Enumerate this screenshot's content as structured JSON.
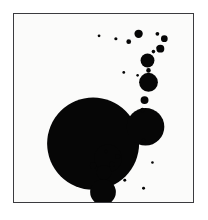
{
  "figure": {
    "title": "",
    "background_color": "#ffffff",
    "panel_background_color": "#fbfbfa",
    "frame_color": "#3b3b3f",
    "mark_color": "#060606",
    "panel": {
      "x": 13,
      "y": 13,
      "width": 181,
      "height": 190
    }
  },
  "chart_data": {
    "type": "scatter",
    "title": "",
    "subtitle": "",
    "xlabel": "",
    "ylabel": "",
    "xlim": [
      0,
      181
    ],
    "ylim": [
      0,
      190
    ],
    "grid": false,
    "legend": null,
    "axis_ticks": {
      "x": [],
      "y": []
    },
    "annotations": [],
    "marker": {
      "shape": "circle",
      "fill": "#060606",
      "edge": "none",
      "size_encodes": "radius"
    },
    "series": [
      {
        "name": "discs",
        "points": [
          {
            "id": "c1",
            "x": 80,
            "y": 131,
            "r": 46.5
          },
          {
            "id": "c2",
            "x": 133,
            "y": 114,
            "r": 19.0
          },
          {
            "id": "c3",
            "x": 90,
            "y": 180,
            "r": 13.0
          },
          {
            "id": "c4",
            "x": 95,
            "y": 146,
            "r": 14.0
          },
          {
            "id": "c5",
            "x": 136,
            "y": 69,
            "r": 9.5
          },
          {
            "id": "c6",
            "x": 91,
            "y": 160,
            "r": 7.5
          },
          {
            "id": "c7",
            "x": 135,
            "y": 47,
            "r": 7.0
          },
          {
            "id": "c8",
            "x": 132,
            "y": 87,
            "r": 4.0
          },
          {
            "id": "c9",
            "x": 126,
            "y": 20,
            "r": 4.2
          },
          {
            "id": "c10",
            "x": 148,
            "y": 35,
            "r": 4.0
          },
          {
            "id": "c11",
            "x": 152,
            "y": 25,
            "r": 3.4
          },
          {
            "id": "c12",
            "x": 80,
            "y": 153,
            "r": 3.2
          },
          {
            "id": "c13",
            "x": 99,
            "y": 152,
            "r": 2.6
          },
          {
            "id": "c14",
            "x": 105,
            "y": 144,
            "r": 2.4
          },
          {
            "id": "c15",
            "x": 116,
            "y": 28,
            "r": 2.4
          },
          {
            "id": "c16",
            "x": 136,
            "y": 57,
            "r": 2.3
          },
          {
            "id": "c17",
            "x": 130,
            "y": 97,
            "r": 2.2
          },
          {
            "id": "c18",
            "x": 146,
            "y": 34,
            "r": 2.0
          },
          {
            "id": "c19",
            "x": 145,
            "y": 20,
            "r": 1.9
          },
          {
            "id": "c20",
            "x": 141,
            "y": 38,
            "r": 1.8
          },
          {
            "id": "c21",
            "x": 131,
            "y": 128,
            "r": 1.9
          },
          {
            "id": "c22",
            "x": 93,
            "y": 139,
            "r": 1.7
          },
          {
            "id": "c23",
            "x": 121,
            "y": 143,
            "r": 1.7
          },
          {
            "id": "c24",
            "x": 103,
            "y": 25,
            "r": 1.6
          },
          {
            "id": "c25",
            "x": 112,
            "y": 168,
            "r": 1.5
          },
          {
            "id": "c26",
            "x": 131,
            "y": 176,
            "r": 1.5
          },
          {
            "id": "c27",
            "x": 86,
            "y": 22,
            "r": 1.4
          },
          {
            "id": "c28",
            "x": 111,
            "y": 59,
            "r": 1.4
          },
          {
            "id": "c29",
            "x": 125,
            "y": 62,
            "r": 1.3
          },
          {
            "id": "c30",
            "x": 140,
            "y": 150,
            "r": 1.3
          }
        ]
      }
    ]
  }
}
